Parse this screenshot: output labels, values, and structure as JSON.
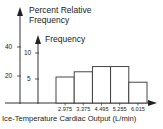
{
  "chart_data": {
    "type": "bar",
    "title": "",
    "xlabel": "Ice-Temperature Cardiac Output (L/min)",
    "ylabel": "Frequency",
    "ylabel_secondary": "Percent Relative Frequency",
    "categories": [
      "2.975",
      "3.375",
      "4.495",
      "5.255",
      "6.015"
    ],
    "series": [
      {
        "name": "Frequency",
        "values": [
          5,
          6,
          7,
          7,
          4
        ]
      }
    ],
    "y_ticks": [
      "5",
      "10"
    ],
    "y_secondary_ticks": [
      "20",
      "40"
    ],
    "ylim": [
      0,
      12
    ],
    "grid": false,
    "legend": "none"
  },
  "labels": {
    "percent_axis_line1": "Percent Relative",
    "percent_axis_line2": "Frequency",
    "frequency_axis": "Frequency",
    "x_axis": "Ice-Temperature Cardiac Output (L/min)",
    "pct_tick_40": "40",
    "pct_tick_20": "20",
    "freq_tick_10": "10",
    "freq_tick_5": "5",
    "x_ticks": [
      "2.975",
      "3.375",
      "4.495",
      "5.255",
      "6.015"
    ]
  },
  "colors": {
    "line": "#333333",
    "bar_fill": "#ffffff"
  }
}
